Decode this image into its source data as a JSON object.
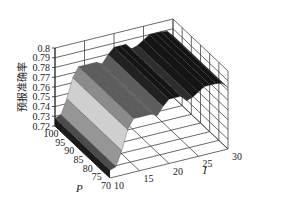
{
  "chart_data": {
    "type": "surface3d",
    "title": "",
    "xlabel": "P",
    "ylabel": "I",
    "zlabel": "预报准确率",
    "x_ticks": [
      100,
      95,
      90,
      85,
      80,
      75,
      70
    ],
    "y_ticks": [
      10,
      15,
      20,
      25,
      30
    ],
    "z_ticks": [
      0.72,
      0.73,
      0.74,
      0.75,
      0.76,
      0.77,
      0.78,
      0.79,
      0.8
    ],
    "xlim": [
      70,
      100
    ],
    "ylim": [
      10,
      30
    ],
    "zlim": [
      0.72,
      0.8
    ],
    "grid": true,
    "colormap": "gray",
    "note": "Surface is constant along P; accuracy varies with I",
    "I": [
      10,
      11,
      12,
      13,
      14,
      15,
      16,
      17,
      18,
      19,
      20,
      21,
      22,
      23,
      24,
      25,
      26,
      27,
      28,
      29,
      30
    ],
    "accuracy_by_I": [
      0.728,
      0.73,
      0.745,
      0.765,
      0.775,
      0.775,
      0.775,
      0.775,
      0.772,
      0.78,
      0.786,
      0.786,
      0.786,
      0.78,
      0.782,
      0.786,
      0.79,
      0.79,
      0.79,
      0.789,
      0.783
    ]
  },
  "labels": {
    "z_axis": "预报准确率",
    "p_axis": "P",
    "i_axis": "I"
  }
}
